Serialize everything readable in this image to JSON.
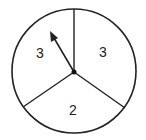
{
  "spinner": {
    "sections": [
      {
        "label": "3",
        "position": "upper-left"
      },
      {
        "label": "3",
        "position": "upper-right"
      },
      {
        "label": "2",
        "position": "bottom"
      }
    ],
    "colors": {
      "stroke": "#222222",
      "fill": "#ffffff"
    }
  }
}
